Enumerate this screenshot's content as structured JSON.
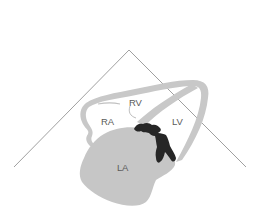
{
  "diagram": {
    "type": "echocardiographic heart view schematic",
    "labels": {
      "rv": "RV",
      "ra": "RA",
      "lv": "LV",
      "la": "LA"
    },
    "colors": {
      "background": "#ffffff",
      "sector_lines": "#777777",
      "heart_wall": "#c8c8c8",
      "left_atrium": "#c6c6c6",
      "mass": "#262626",
      "label_text": "#5a5a5a"
    }
  }
}
